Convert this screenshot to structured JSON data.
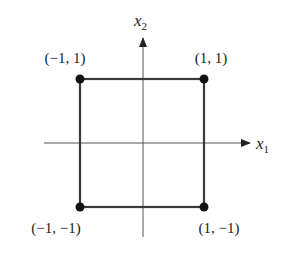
{
  "diagram": {
    "axes": {
      "horizontal": {
        "var": "x",
        "sub": "1"
      },
      "vertical": {
        "var": "x",
        "sub": "2"
      }
    },
    "vertices": [
      {
        "label": "(−1, 1)",
        "x": -1,
        "y": 1
      },
      {
        "label": "(1, 1)",
        "x": 1,
        "y": 1
      },
      {
        "label": "(−1, −1)",
        "x": -1,
        "y": -1
      },
      {
        "label": "(1, −1)",
        "x": 1,
        "y": -1
      }
    ],
    "colors": {
      "square": "#3a3a3a",
      "axis": "#555555",
      "point": "#111111"
    }
  }
}
